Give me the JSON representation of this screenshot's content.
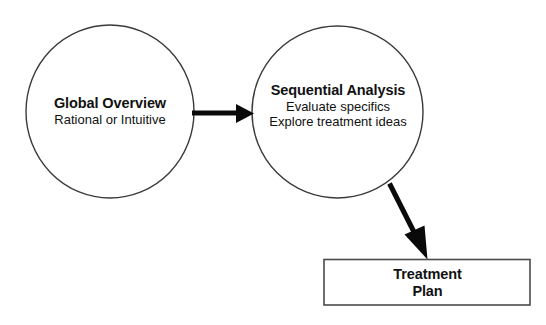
{
  "diagram": {
    "nodes": [
      {
        "id": "global-overview",
        "shape": "ellipse",
        "title": "Global Overview",
        "lines": [
          "Rational or Intuitive"
        ]
      },
      {
        "id": "sequential-analysis",
        "shape": "ellipse",
        "title": "Sequential Analysis",
        "lines": [
          "Evaluate specifics",
          "Explore treatment ideas"
        ]
      },
      {
        "id": "treatment-plan",
        "shape": "rectangle",
        "title_line1": "Treatment",
        "title_line2": "Plan"
      }
    ],
    "connectors": [
      {
        "id": "global-to-sequential",
        "from": "global-overview",
        "to": "sequential-analysis",
        "direction": "horizontal-right"
      },
      {
        "id": "sequential-to-treatment",
        "from": "sequential-analysis",
        "to": "treatment-plan",
        "direction": "diagonal-down-right"
      }
    ],
    "colors": {
      "background": "#ffffff",
      "outline": "#3a3a3a",
      "box_outline": "#4a4a4a",
      "arrow": "#0a0a0a",
      "text": "#111111"
    }
  }
}
